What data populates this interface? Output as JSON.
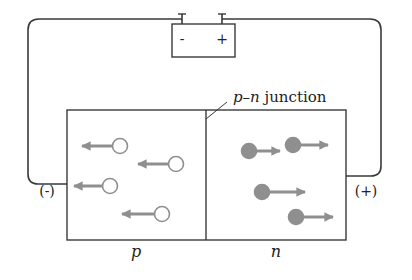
{
  "diagram": {
    "battery": {
      "minus_label": "-",
      "plus_label": "+"
    },
    "junction_label_p": "p",
    "junction_label_dash": "–",
    "junction_label_n": "n",
    "junction_label_suffix": " junction",
    "left_terminal_label": "(-)",
    "right_terminal_label": "(+)",
    "region_p_label": "p",
    "region_n_label": "n",
    "colors": {
      "wire": "#3a3a3a",
      "carrier": "#8f8f8f",
      "hole_fill": "#ffffff",
      "electron_fill": "#8f8f8f"
    },
    "holes": [
      {
        "cx": 120,
        "cy": 146,
        "arrow_to_x": 82
      },
      {
        "cx": 176,
        "cy": 164,
        "arrow_to_x": 138
      },
      {
        "cx": 110,
        "cy": 186,
        "arrow_to_x": 74
      },
      {
        "cx": 162,
        "cy": 214,
        "arrow_to_x": 122
      }
    ],
    "electrons": [
      {
        "cx": 249,
        "cy": 151,
        "arrow_to_x": 280
      },
      {
        "cx": 293,
        "cy": 145,
        "arrow_to_x": 328
      },
      {
        "cx": 262,
        "cy": 192,
        "arrow_to_x": 305
      },
      {
        "cx": 296,
        "cy": 217,
        "arrow_to_x": 333
      }
    ]
  }
}
